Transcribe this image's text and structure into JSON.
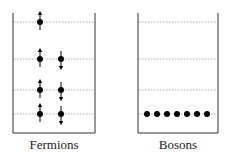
{
  "fermions": {
    "label": "Fermions",
    "levels_y": [
      22,
      59,
      90,
      114
    ],
    "particles": [
      {
        "level": 0,
        "spin": "up",
        "column": 0
      },
      {
        "level": 1,
        "spin": "up",
        "column": 0
      },
      {
        "level": 1,
        "spin": "down",
        "column": 1
      },
      {
        "level": 2,
        "spin": "up",
        "column": 0
      },
      {
        "level": 2,
        "spin": "down",
        "column": 1
      },
      {
        "level": 3,
        "spin": "up",
        "column": 0
      },
      {
        "level": 3,
        "spin": "down",
        "column": 1
      }
    ]
  },
  "bosons": {
    "label": "Bosons",
    "levels_y": [
      22,
      59,
      90,
      114
    ],
    "particle_count": 7,
    "occupied_level": 3
  },
  "colors": {
    "line": "#333333",
    "dash": "#999999",
    "particle": "#000000"
  }
}
